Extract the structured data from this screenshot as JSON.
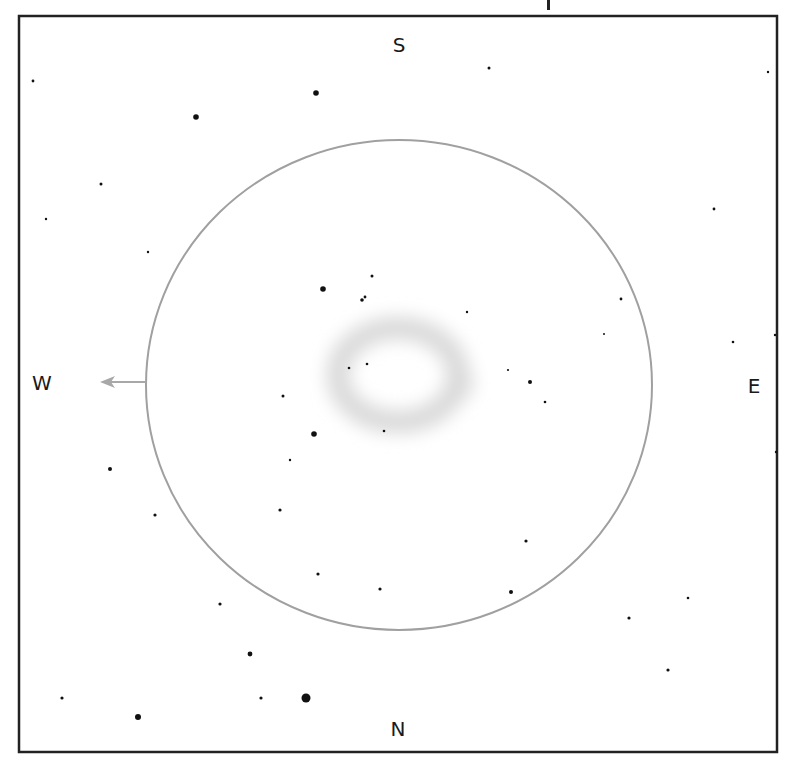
{
  "sketch": {
    "title_fragment": "p",
    "frame": {
      "x": 19,
      "y": 16,
      "width": 758,
      "height": 736,
      "stroke": "#222222",
      "stroke_width": 2.5
    },
    "field_of_view": {
      "cx": 399,
      "cy": 385,
      "rx": 253,
      "ry": 245,
      "stroke": "#a0a0a0",
      "stroke_width": 2
    },
    "nebula": {
      "cx": 398,
      "cy": 375,
      "rx": 60,
      "ry": 47,
      "ring_width": 22,
      "color": "#d8d8d8"
    },
    "direction_arrow": {
      "from_x": 146,
      "to_x": 100,
      "y": 382,
      "color": "#a8a8a8"
    },
    "cardinal": {
      "south": {
        "text": "S",
        "x": 399,
        "y": 45
      },
      "north": {
        "text": "N",
        "x": 398,
        "y": 729
      },
      "west": {
        "text": "W",
        "x": 42,
        "y": 383
      },
      "east": {
        "text": "E",
        "x": 754,
        "y": 386
      }
    },
    "star_color": "#111111",
    "stars": [
      {
        "x": 33,
        "y": 81,
        "r": 1.4
      },
      {
        "x": 489,
        "y": 68,
        "r": 1.5
      },
      {
        "x": 768,
        "y": 72,
        "r": 1.2
      },
      {
        "x": 316,
        "y": 93,
        "r": 2.8
      },
      {
        "x": 196,
        "y": 117,
        "r": 2.8
      },
      {
        "x": 101,
        "y": 184,
        "r": 1.5
      },
      {
        "x": 46,
        "y": 219,
        "r": 1.2
      },
      {
        "x": 148,
        "y": 252,
        "r": 1.2
      },
      {
        "x": 714,
        "y": 209,
        "r": 1.4
      },
      {
        "x": 372,
        "y": 276,
        "r": 1.5
      },
      {
        "x": 323,
        "y": 289,
        "r": 2.8
      },
      {
        "x": 365,
        "y": 297,
        "r": 1.4
      },
      {
        "x": 362,
        "y": 300,
        "r": 1.8
      },
      {
        "x": 621,
        "y": 299,
        "r": 1.4
      },
      {
        "x": 467,
        "y": 312,
        "r": 1.2
      },
      {
        "x": 604,
        "y": 334,
        "r": 1.0
      },
      {
        "x": 733,
        "y": 342,
        "r": 1.3
      },
      {
        "x": 775,
        "y": 335,
        "r": 1.2
      },
      {
        "x": 367,
        "y": 364,
        "r": 1.3
      },
      {
        "x": 349,
        "y": 368,
        "r": 1.3
      },
      {
        "x": 508,
        "y": 370,
        "r": 1.1
      },
      {
        "x": 530,
        "y": 382,
        "r": 2.0
      },
      {
        "x": 283,
        "y": 396,
        "r": 1.5
      },
      {
        "x": 545,
        "y": 402,
        "r": 1.3
      },
      {
        "x": 384,
        "y": 431,
        "r": 1.3
      },
      {
        "x": 314,
        "y": 434,
        "r": 2.8
      },
      {
        "x": 290,
        "y": 460,
        "r": 1.2
      },
      {
        "x": 776,
        "y": 452,
        "r": 1.2
      },
      {
        "x": 110,
        "y": 469,
        "r": 2.0
      },
      {
        "x": 155,
        "y": 515,
        "r": 1.6
      },
      {
        "x": 280,
        "y": 510,
        "r": 1.6
      },
      {
        "x": 526,
        "y": 541,
        "r": 1.6
      },
      {
        "x": 318,
        "y": 574,
        "r": 1.6
      },
      {
        "x": 380,
        "y": 589,
        "r": 1.6
      },
      {
        "x": 511,
        "y": 592,
        "r": 2.0
      },
      {
        "x": 688,
        "y": 598,
        "r": 1.3
      },
      {
        "x": 220,
        "y": 604,
        "r": 1.6
      },
      {
        "x": 629,
        "y": 618,
        "r": 1.6
      },
      {
        "x": 250,
        "y": 654,
        "r": 2.4
      },
      {
        "x": 668,
        "y": 670,
        "r": 1.6
      },
      {
        "x": 62,
        "y": 698,
        "r": 1.6
      },
      {
        "x": 261,
        "y": 698,
        "r": 1.6
      },
      {
        "x": 306,
        "y": 698,
        "r": 4.5
      },
      {
        "x": 138,
        "y": 717,
        "r": 3.0
      }
    ]
  }
}
